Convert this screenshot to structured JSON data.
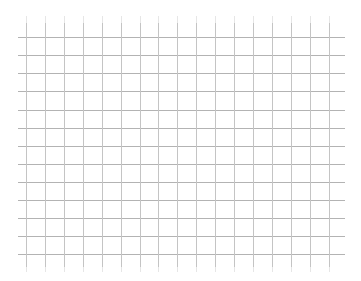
{
  "chart_data": {
    "type": "line",
    "title": "",
    "xlabel": "",
    "ylabel": "",
    "series": [],
    "grid": true,
    "legend": null,
    "x_gridlines_px": [
      26,
      45,
      64,
      83,
      102,
      121,
      140,
      158,
      177,
      196,
      215,
      234,
      253,
      272,
      291,
      310,
      329
    ],
    "y_gridlines_px": [
      37,
      55,
      73,
      91,
      110,
      128,
      146,
      164,
      182,
      200,
      218,
      236,
      254
    ],
    "x_tick_labels": [],
    "y_tick_labels": []
  },
  "style": {
    "background": "#ffffff",
    "horizontal_line_color": "#b3b3b3",
    "vertical_line_color": "#c4c4c4",
    "tick_color": "#e6e6e6",
    "grid_left": 18,
    "grid_right": 345,
    "grid_top": 23,
    "grid_bottom": 267,
    "tick_top": 16,
    "tick_bottom": 272
  }
}
